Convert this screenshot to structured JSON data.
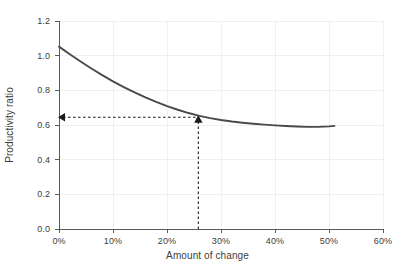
{
  "chart_data": {
    "type": "line",
    "title": "",
    "xlabel": "Amount of change",
    "ylabel": "Productivity ratio",
    "xlim": [
      0,
      60
    ],
    "ylim": [
      0.0,
      1.2
    ],
    "grid": true,
    "legend": "none",
    "x_tick_labels": [
      "0%",
      "10%",
      "20%",
      "30%",
      "40%",
      "50%",
      "60%"
    ],
    "x_ticks": [
      0,
      10,
      20,
      30,
      40,
      50,
      60
    ],
    "y_tick_labels": [
      "0.0",
      "0.2",
      "0.4",
      "0.6",
      "0.8",
      "1.0",
      "1.2"
    ],
    "y_ticks": [
      0.0,
      0.2,
      0.4,
      0.6,
      0.8,
      1.0,
      1.2
    ],
    "x_unit": "percent",
    "series": [
      {
        "name": "Productivity ratio",
        "color": "#4a4a4a",
        "x": [
          0,
          2,
          4,
          6,
          8,
          10,
          12,
          14,
          16,
          18,
          20,
          22,
          24,
          26,
          28,
          30,
          32,
          34,
          36,
          38,
          40,
          42,
          44,
          46,
          48,
          50,
          51
        ],
        "values": [
          1.052,
          1.008,
          0.966,
          0.926,
          0.888,
          0.852,
          0.819,
          0.788,
          0.759,
          0.733,
          0.709,
          0.688,
          0.669,
          0.653,
          0.64,
          0.629,
          0.62,
          0.613,
          0.607,
          0.602,
          0.598,
          0.594,
          0.591,
          0.589,
          0.589,
          0.592,
          0.595
        ]
      }
    ],
    "annotations": [
      {
        "name": "reference-marker",
        "x": 25.8,
        "y": 0.645,
        "style": "dashed",
        "color": "#1a1a1a",
        "description": "Dashed guide lines from the x-axis up to the curve and across to the y-axis with arrowheads"
      }
    ],
    "colors": {
      "curve": "#4a4a4a",
      "axis": "#5a5a5a",
      "grid": "#ececec",
      "annotation": "#1a1a1a",
      "text": "#3d3d3d",
      "background": "#ffffff"
    }
  }
}
